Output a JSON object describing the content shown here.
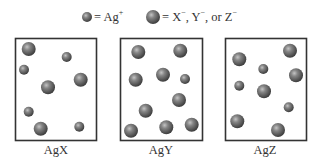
{
  "legend": {
    "items": [
      {
        "kind": "small",
        "symbol": "= Ag",
        "charge": "+",
        "cx": 87,
        "cy": 17,
        "r": 5,
        "text_x": 94
      },
      {
        "kind": "large",
        "symbol": "= X",
        "charge": "−",
        "rest": ", Y",
        "charge2": "−",
        "rest2": ", or Z",
        "charge3": "−",
        "cx": 153,
        "cy": 17,
        "r": 7,
        "text_x": 162
      }
    ],
    "small_label": "= Ag",
    "small_charge": "+",
    "large_label_1": "= X",
    "large_charge_1": "−",
    "large_label_2": ", Y",
    "large_charge_2": "−",
    "large_label_3": ", or Z",
    "large_charge_3": "−"
  },
  "colors": {
    "sphere_highlight": "#b0b0b0",
    "sphere_mid": "#7a7a7a",
    "sphere_edge": "#3e3e3e",
    "box_stroke": "#333333",
    "text": "#333333"
  },
  "boxes": [
    {
      "label": "AgX",
      "x": 15,
      "y": 38,
      "w": 81,
      "h": 102,
      "label_x": 27,
      "spheres": [
        {
          "type": "large",
          "cx": 28.7,
          "cy": 49,
          "r": 7
        },
        {
          "type": "small",
          "cx": 66.7,
          "cy": 57,
          "r": 5
        },
        {
          "type": "small",
          "cx": 24,
          "cy": 69.7,
          "r": 5
        },
        {
          "type": "large",
          "cx": 80.7,
          "cy": 79.7,
          "r": 7
        },
        {
          "type": "large",
          "cx": 48,
          "cy": 87.3,
          "r": 7
        },
        {
          "type": "small",
          "cx": 28.7,
          "cy": 111.7,
          "r": 5
        },
        {
          "type": "large",
          "cx": 40.7,
          "cy": 128.7,
          "r": 7
        },
        {
          "type": "small",
          "cx": 79.3,
          "cy": 126.7,
          "r": 5
        }
      ]
    },
    {
      "label": "AgY",
      "x": 120,
      "y": 38,
      "w": 82,
      "h": 102,
      "label_x": 131,
      "spheres": [
        {
          "type": "large",
          "cx": 138.3,
          "cy": 52,
          "r": 7
        },
        {
          "type": "large",
          "cx": 180.3,
          "cy": 50.7,
          "r": 7
        },
        {
          "type": "large",
          "cx": 135.7,
          "cy": 79.7,
          "r": 7
        },
        {
          "type": "large",
          "cx": 163,
          "cy": 74.7,
          "r": 7
        },
        {
          "type": "small",
          "cx": 185,
          "cy": 79,
          "r": 5
        },
        {
          "type": "large",
          "cx": 179,
          "cy": 100,
          "r": 7
        },
        {
          "type": "large",
          "cx": 145.7,
          "cy": 110.7,
          "r": 7
        },
        {
          "type": "large",
          "cx": 131,
          "cy": 130.7,
          "r": 7
        },
        {
          "type": "large",
          "cx": 166.3,
          "cy": 127.3,
          "r": 7
        },
        {
          "type": "large",
          "cx": 191.7,
          "cy": 124.7,
          "r": 7
        }
      ]
    },
    {
      "label": "AgZ",
      "x": 225,
      "y": 38,
      "w": 81,
      "h": 102,
      "label_x": 235,
      "spheres": [
        {
          "type": "large",
          "cx": 239.3,
          "cy": 59.3,
          "r": 7
        },
        {
          "type": "large",
          "cx": 290,
          "cy": 50.7,
          "r": 7
        },
        {
          "type": "small",
          "cx": 263.3,
          "cy": 69,
          "r": 5
        },
        {
          "type": "large",
          "cx": 296,
          "cy": 75.3,
          "r": 7
        },
        {
          "type": "small",
          "cx": 239.3,
          "cy": 85.7,
          "r": 5
        },
        {
          "type": "large",
          "cx": 264,
          "cy": 91.3,
          "r": 7
        },
        {
          "type": "small",
          "cx": 288.7,
          "cy": 107.3,
          "r": 5
        },
        {
          "type": "large",
          "cx": 237.3,
          "cy": 121.3,
          "r": 7
        },
        {
          "type": "large",
          "cx": 278,
          "cy": 130,
          "r": 7
        }
      ]
    }
  ]
}
